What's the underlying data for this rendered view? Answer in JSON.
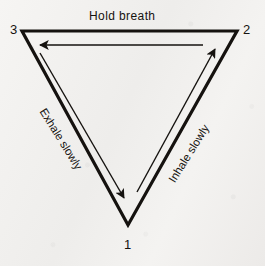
{
  "diagram": {
    "title_label": "Hold breath",
    "vertices": [
      {
        "id": "3",
        "label": "3",
        "position": "top-left"
      },
      {
        "id": "2",
        "label": "2",
        "position": "top-right"
      },
      {
        "id": "1",
        "label": "1",
        "position": "bottom"
      }
    ],
    "edges": [
      {
        "name": "hold-breath",
        "label": "Hold breath",
        "from": "2",
        "to": "3",
        "direction": "left"
      },
      {
        "name": "exhale",
        "label": "Exhale slowly",
        "from": "3",
        "to": "1",
        "direction": "down-right"
      },
      {
        "name": "inhale",
        "label": "Inhale slowly",
        "from": "1",
        "to": "2",
        "direction": "up-right"
      }
    ],
    "colors": {
      "ink": "#15120f",
      "paper": "#f2f1ef"
    }
  }
}
